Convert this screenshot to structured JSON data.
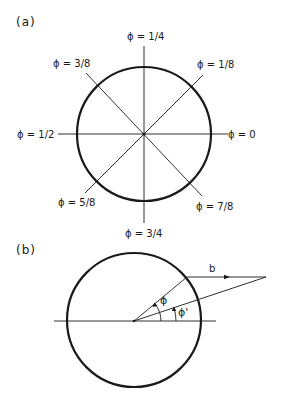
{
  "panel_a": {
    "label": "(a)",
    "circle": {
      "cx": 144,
      "cy": 134,
      "r": 67
    },
    "phase_labels": [
      {
        "id": "phi-0",
        "text": "ϕ = 0",
        "angle_deg": 0
      },
      {
        "id": "phi-1-8",
        "text": "ϕ = 1/8",
        "angle_deg": 45
      },
      {
        "id": "phi-1-4",
        "text": "ϕ = 1/4",
        "angle_deg": 90
      },
      {
        "id": "phi-3-8",
        "text": "ϕ = 3/8",
        "angle_deg": 135
      },
      {
        "id": "phi-1-2",
        "text": "ϕ = 1/2",
        "angle_deg": 180
      },
      {
        "id": "phi-5-8",
        "text": "ϕ = 5/8",
        "angle_deg": 225
      },
      {
        "id": "phi-3-4",
        "text": "ϕ = 3/4",
        "angle_deg": 270
      },
      {
        "id": "phi-7-8",
        "text": "ϕ = 7/8",
        "angle_deg": 315
      }
    ]
  },
  "panel_b": {
    "label": "(b)",
    "circle": {
      "cx": 134,
      "cy": 320,
      "r": 67
    },
    "vector_label": "b",
    "angle_label_phi": "ϕ",
    "angle_label_phi_prime": "ϕ'"
  }
}
